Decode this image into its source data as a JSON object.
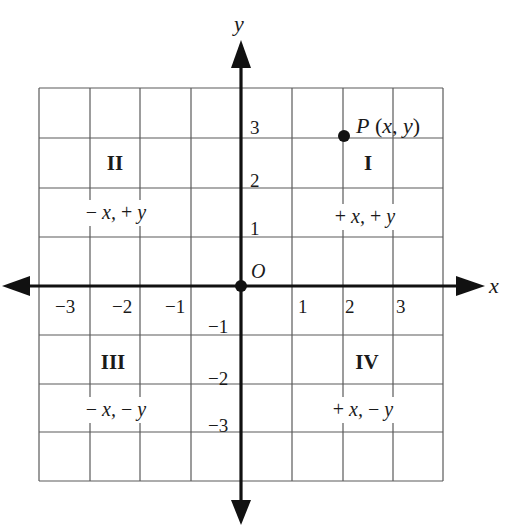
{
  "diagram": {
    "axes": {
      "x_label": "x",
      "y_label": "y",
      "origin_label": "O"
    },
    "x_ticks": [
      {
        "value": -3,
        "label": "−3"
      },
      {
        "value": -2,
        "label": "−2"
      },
      {
        "value": -1,
        "label": "−1"
      },
      {
        "value": 1,
        "label": "1"
      },
      {
        "value": 2,
        "label": "2"
      },
      {
        "value": 3,
        "label": "3"
      }
    ],
    "y_ticks": [
      {
        "value": 3,
        "label": "3"
      },
      {
        "value": 2,
        "label": "2"
      },
      {
        "value": 1,
        "label": "1"
      },
      {
        "value": -1,
        "label": "−1"
      },
      {
        "value": -2,
        "label": "−2"
      },
      {
        "value": -3,
        "label": "−3"
      }
    ],
    "quadrants": [
      {
        "numeral": "I",
        "sign_x": "+",
        "sign_y": "+",
        "sign_text": "+ x, + y"
      },
      {
        "numeral": "II",
        "sign_x": "−",
        "sign_y": "+",
        "sign_text": "− x, + y"
      },
      {
        "numeral": "III",
        "sign_x": "−",
        "sign_y": "−",
        "sign_text": "− x, − y"
      },
      {
        "numeral": "IV",
        "sign_x": "+",
        "sign_y": "−",
        "sign_text": "+ x, − y"
      }
    ],
    "point": {
      "name": "P",
      "label": "P (x, y)",
      "x": 2,
      "y": 3
    },
    "grid": {
      "x_range": [
        -4,
        4
      ],
      "y_range": [
        -4,
        4
      ]
    },
    "colors": {
      "axis": "#111111",
      "grid": "#5a5a5a",
      "background": "#ffffff"
    }
  }
}
